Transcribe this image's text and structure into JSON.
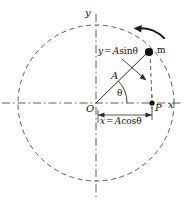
{
  "figure": {
    "background_color": "#ffffff",
    "stroke_color": "#3a3a3a",
    "text_color": "#111111",
    "geometry": {
      "center_x": 96,
      "center_y": 103,
      "radius": 78,
      "theta_degrees": 40,
      "mass_x": 148,
      "mass_y": 52,
      "proj_x": 153,
      "proj_y": 103
    },
    "labels": {
      "y_axis": "y",
      "x_axis": "x",
      "origin": "O",
      "point_p": "P",
      "mass": "m",
      "amplitude": "A",
      "angle": "θ",
      "y_component": {
        "lhs": "y",
        "operator": "=",
        "amplitude": "A",
        "function": "sin",
        "angle": "θ"
      },
      "x_component": {
        "lhs": "x",
        "operator": "=",
        "amplitude": "A",
        "function": "cos",
        "angle": "θ"
      }
    },
    "elements": {
      "circle": "dashed-circle",
      "x_axis_line": "dashed-horizontal-axis",
      "y_axis_line": "dashed-vertical-axis",
      "radius_line": "solid-radius-segment",
      "projection_line": "dashed-vertical-drop",
      "dimension_line": "x-component-dimension-bracket",
      "motion_arrow": "counterclockwise-motion-arrow",
      "leader_line": "y-component-leader-arrow",
      "mass_dot": "filled-mass-point",
      "p_dot": "filled-projection-point"
    }
  }
}
